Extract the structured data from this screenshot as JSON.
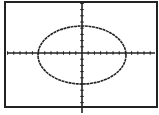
{
  "screen": {
    "background": "#ffffff",
    "ink": "#222222",
    "frame": {
      "x": 5,
      "y": 2,
      "width": 152,
      "height": 105
    }
  },
  "chart_data": {
    "type": "line",
    "title": "",
    "xlabel": "",
    "ylabel": "",
    "curve": {
      "shape": "ellipse",
      "center": [
        0,
        0
      ],
      "semi_axis_x_ticks": 7,
      "semi_axis_y_ticks": 4.5,
      "equation_estimate": "x^2/49 + y^2/20 = 1"
    },
    "axes": {
      "origin_px": [
        82,
        53
      ],
      "tick_spacing_px": 6.2,
      "x_ticks_left": 12,
      "x_ticks_right": 12,
      "y_ticks_up": 8,
      "y_ticks_down": 8,
      "xlim_ticks": [
        -12.5,
        12.5
      ],
      "ylim_ticks": [
        -8.5,
        8.5
      ],
      "grid": false
    },
    "ellipse_px": {
      "cx": 82,
      "cy": 55,
      "rx": 44,
      "ry": 29
    }
  }
}
